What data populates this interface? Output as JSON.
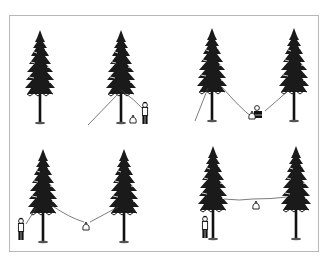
{
  "figure": {
    "panels": [
      {
        "id": 1,
        "position": "top-left",
        "label": "Person throws rope over branch of tree, bag on ground"
      },
      {
        "id": 2,
        "position": "top-right",
        "label": "Person ties bag to rope strung between two trees"
      },
      {
        "id": 3,
        "position": "bottom-left",
        "label": "Person hauls rope, bag rises between trees"
      },
      {
        "id": 4,
        "position": "bottom-right",
        "label": "Bag suspended high between trees, rope tied off"
      }
    ],
    "colors": {
      "ink": "#111111",
      "rope": "#444444",
      "frame": "#b8b8b8",
      "background": "#ffffff"
    }
  }
}
